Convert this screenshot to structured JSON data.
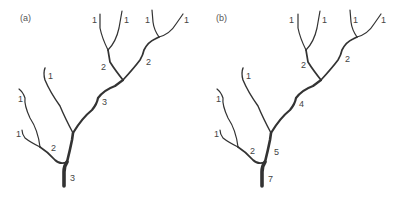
{
  "panels": [
    {
      "id": "a",
      "label": "(a)",
      "scheme": "Strahler stream order",
      "labels": {
        "l1a": "1",
        "l1b": "1",
        "l1c": "1",
        "l1d": "1",
        "l1e": "1",
        "l1f": "1",
        "l1g": "1",
        "u2a": "2",
        "u2b": "2",
        "mid": "3",
        "low2": "2",
        "trunk": "3",
        "root": "3"
      }
    },
    {
      "id": "b",
      "label": "(b)",
      "scheme": "Shreve stream magnitude",
      "labels": {
        "l1a": "1",
        "l1b": "1",
        "l1c": "1",
        "l1d": "1",
        "l1e": "1",
        "l1f": "1",
        "l1g": "1",
        "u2a": "2",
        "u2b": "2",
        "mid": "4",
        "low2": "2",
        "trunk": "5",
        "root": "7"
      }
    }
  ],
  "colors": {
    "stroke": "#333333",
    "text": "#444444",
    "background": "#ffffff"
  }
}
